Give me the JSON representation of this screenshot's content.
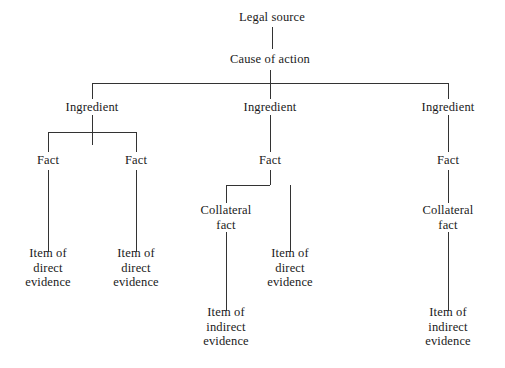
{
  "diagram": {
    "title": "Legal source",
    "type": "hierarchical-tree",
    "orientation": "top-down",
    "background_color": "#ffffff",
    "line_color": "#333333",
    "text_color": "#1a1a1a",
    "canvas": {
      "width": 505,
      "height": 368
    },
    "nodes": [
      {
        "id": "legal-source",
        "label": "Legal source",
        "x": 272,
        "y": 17,
        "level": 0
      },
      {
        "id": "cause-of-action",
        "label": "Cause of action",
        "x": 270,
        "y": 59,
        "level": 1
      },
      {
        "id": "ingredient-left",
        "label": "Ingredient",
        "x": 92,
        "y": 107,
        "level": 2
      },
      {
        "id": "ingredient-middle",
        "label": "Ingredient",
        "x": 270,
        "y": 107,
        "level": 2
      },
      {
        "id": "ingredient-right",
        "label": "Ingredient",
        "x": 448,
        "y": 107,
        "level": 2
      },
      {
        "id": "fact-left-1",
        "label": "Fact",
        "x": 48,
        "y": 160,
        "level": 3
      },
      {
        "id": "fact-left-2",
        "label": "Fact",
        "x": 136,
        "y": 160,
        "level": 3
      },
      {
        "id": "fact-middle",
        "label": "Fact",
        "x": 270,
        "y": 160,
        "level": 3
      },
      {
        "id": "fact-right",
        "label": "Fact",
        "x": 448,
        "y": 160,
        "level": 3
      },
      {
        "id": "collateral-fact-middle",
        "label": "Collateral\nfact",
        "x": 226,
        "y": 217,
        "level": 4
      },
      {
        "id": "collateral-fact-right",
        "label": "Collateral\nfact",
        "x": 448,
        "y": 217,
        "level": 4
      },
      {
        "id": "direct-evidence-1",
        "label": "Item of\ndirect\nevidence",
        "x": 48,
        "y": 268,
        "level": 5
      },
      {
        "id": "direct-evidence-2",
        "label": "Item of\ndirect\nevidence",
        "x": 136,
        "y": 268,
        "level": 5
      },
      {
        "id": "direct-evidence-3",
        "label": "Item of\ndirect\nevidence",
        "x": 290,
        "y": 268,
        "level": 5
      },
      {
        "id": "indirect-evidence-1",
        "label": "Item of\nindirect\nevidence",
        "x": 226,
        "y": 327,
        "level": 6
      },
      {
        "id": "indirect-evidence-2",
        "label": "Item of\nindirect\nevidence",
        "x": 448,
        "y": 327,
        "level": 6
      }
    ],
    "edges": [
      {
        "id": "edge-legal-source-to-cause",
        "from": "legal-source",
        "to": "cause-of-action",
        "path": "M272,27 L272,49"
      },
      {
        "id": "edge-cause-to-trunk",
        "from": "cause-of-action",
        "to": "ingredient-bus",
        "path": "M270,70 L270,83"
      },
      {
        "id": "edge-ingredient-bus",
        "from": "ingredient-bus",
        "to": "ingredient-bus",
        "path": "M92,83 L448,83"
      },
      {
        "id": "edge-bus-to-ingredient-left",
        "from": "ingredient-bus",
        "to": "ingredient-left",
        "path": "M92,83 L92,99"
      },
      {
        "id": "edge-bus-to-ingredient-middle",
        "from": "ingredient-bus",
        "to": "ingredient-middle",
        "path": "M270,83 L270,99"
      },
      {
        "id": "edge-bus-to-ingredient-right",
        "from": "ingredient-bus",
        "to": "ingredient-right",
        "path": "M448,83 L448,99"
      },
      {
        "id": "edge-ingredient-left-to-fact-bus",
        "from": "ingredient-left",
        "to": "fact-bus-left",
        "path": "M92,115 L92,145"
      },
      {
        "id": "edge-fact-bus-left",
        "from": "fact-bus-left",
        "to": "fact-bus-left",
        "path": "M48,132 L136,132"
      },
      {
        "id": "edge-fact-bus-to-fact-left-1",
        "from": "fact-bus-left",
        "to": "fact-left-1",
        "path": "M48,132 L48,152"
      },
      {
        "id": "edge-fact-bus-to-fact-left-2",
        "from": "fact-bus-left",
        "to": "fact-left-2",
        "path": "M136,132 L136,152"
      },
      {
        "id": "edge-fact-left-1-to-evidence",
        "from": "fact-left-1",
        "to": "direct-evidence-1",
        "path": "M48,170 L48,252"
      },
      {
        "id": "edge-fact-left-2-to-evidence",
        "from": "fact-left-2",
        "to": "direct-evidence-2",
        "path": "M136,170 L136,252"
      },
      {
        "id": "edge-ingredient-middle-to-fact",
        "from": "ingredient-middle",
        "to": "fact-middle",
        "path": "M270,115 L270,152"
      },
      {
        "id": "edge-fact-middle-stem",
        "from": "fact-middle",
        "to": "fact-middle-bus",
        "path": "M270,170 L270,185"
      },
      {
        "id": "edge-fact-middle-bus",
        "from": "fact-middle-bus",
        "to": "fact-middle-bus",
        "path": "M226,185 L270,185"
      },
      {
        "id": "edge-bus-to-collateral-middle",
        "from": "fact-middle-bus",
        "to": "collateral-fact-middle",
        "path": "M226,185 L226,203"
      },
      {
        "id": "edge-fact-middle-to-direct",
        "from": "fact-middle",
        "to": "direct-evidence-3",
        "path": "M290,185 L290,252"
      },
      {
        "id": "edge-collateral-to-indirect-mid",
        "from": "collateral-fact-middle",
        "to": "indirect-evidence-1",
        "path": "M226,232 L226,311"
      },
      {
        "id": "edge-ingredient-right-to-fact",
        "from": "ingredient-right",
        "to": "fact-right",
        "path": "M448,115 L448,152"
      },
      {
        "id": "edge-fact-right-to-collateral",
        "from": "fact-right",
        "to": "collateral-fact-right",
        "path": "M448,170 L448,203"
      },
      {
        "id": "edge-collateral-to-indirect-right",
        "from": "collateral-fact-right",
        "to": "indirect-evidence-2",
        "path": "M448,232 L448,311"
      }
    ]
  }
}
